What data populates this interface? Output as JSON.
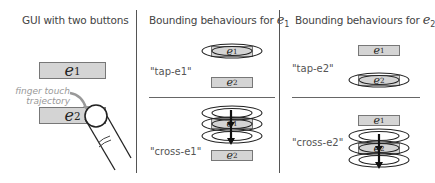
{
  "panels": [
    {
      "title": "GUI with two buttons",
      "buttons": [
        {
          "var": "e",
          "sub": "1"
        },
        {
          "var": "e",
          "sub": "2"
        }
      ],
      "annotation": {
        "line1": "finger touch",
        "line2": "trajectory"
      }
    },
    {
      "title_prefix": "Bounding behaviours for ",
      "title_var": "e",
      "title_sub": "1",
      "rows": [
        {
          "label": "\"tap-e1\"",
          "buttons": [
            {
              "var": "e",
              "sub": "1"
            },
            {
              "var": "e",
              "sub": "2"
            }
          ]
        },
        {
          "label": "\"cross-e1\"",
          "buttons": [
            {
              "var": "e",
              "sub": "1"
            },
            {
              "var": "e",
              "sub": "2"
            }
          ]
        }
      ]
    },
    {
      "title_prefix": "Bounding behaviours for ",
      "title_var": "e",
      "title_sub": "2",
      "rows": [
        {
          "label": "\"tap-e2\"",
          "buttons": [
            {
              "var": "e",
              "sub": "1"
            },
            {
              "var": "e",
              "sub": "2"
            }
          ]
        },
        {
          "label": "\"cross-e2\"",
          "buttons": [
            {
              "var": "e",
              "sub": "1"
            },
            {
              "var": "e",
              "sub": "2"
            }
          ]
        }
      ]
    }
  ],
  "colors": {
    "button_fill": "#d4d4d4",
    "button_border": "#777777",
    "divider": "#555555",
    "annotation": "#999999"
  }
}
